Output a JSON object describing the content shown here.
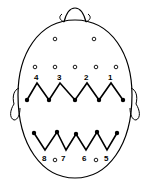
{
  "diagram": {
    "colors": {
      "ink": "#000000",
      "background": "#ffffff"
    },
    "upper_row_labels": [
      "4",
      "3",
      "2",
      "1"
    ],
    "lower_row_labels": [
      "8",
      "7",
      "6",
      "5"
    ],
    "label_positions": {
      "upper": [
        [
          34,
          80
        ],
        [
          57,
          80
        ],
        [
          84,
          80
        ],
        [
          108,
          80
        ]
      ],
      "lower": [
        [
          42,
          161
        ],
        [
          61,
          161
        ],
        [
          82,
          161
        ],
        [
          104,
          161
        ]
      ]
    },
    "open_electrodes": [
      [
        55,
        39
      ],
      [
        94,
        39
      ],
      [
        35,
        67
      ],
      [
        55,
        67
      ],
      [
        75,
        67
      ],
      [
        96,
        67
      ],
      [
        116,
        67
      ],
      [
        55,
        160
      ],
      [
        96,
        160
      ]
    ],
    "upper_zigzag": [
      [
        27,
        100
      ],
      [
        37,
        83
      ],
      [
        49,
        100
      ],
      [
        60,
        83
      ],
      [
        75,
        100
      ],
      [
        87,
        83
      ],
      [
        99,
        100
      ],
      [
        111,
        83
      ],
      [
        123,
        100
      ]
    ],
    "upper_filled": [
      [
        27,
        100
      ],
      [
        49,
        100
      ],
      [
        75,
        100
      ],
      [
        99,
        100
      ],
      [
        123,
        100
      ]
    ],
    "lower_zigzag": [
      [
        34,
        133
      ],
      [
        45,
        150
      ],
      [
        57,
        132
      ],
      [
        66,
        150
      ],
      [
        76,
        134
      ],
      [
        86,
        150
      ],
      [
        97,
        132
      ],
      [
        107,
        150
      ],
      [
        117,
        133
      ]
    ],
    "lower_filled": [
      [
        34,
        133
      ],
      [
        57,
        132
      ],
      [
        76,
        134
      ],
      [
        97,
        132
      ],
      [
        117,
        133
      ]
    ]
  }
}
